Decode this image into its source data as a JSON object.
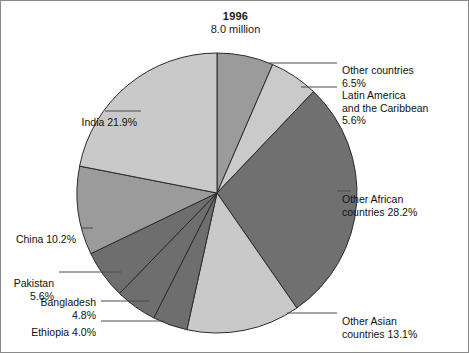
{
  "chart_data": {
    "type": "pie",
    "title": "1996",
    "subtitle": "8.0 million",
    "xlabel": "",
    "ylabel": "",
    "legend_position": "callout-labels",
    "grid": false,
    "start_angle_deg": 0,
    "direction": "clockwise",
    "categories": [
      "Other countries",
      "Latin America and the Caribbean",
      "Other African countries",
      "Other Asian countries",
      "Ethiopia",
      "Bangladesh",
      "Pakistan",
      "China",
      "India"
    ],
    "values": [
      6.5,
      5.6,
      28.2,
      13.1,
      4.0,
      4.8,
      5.6,
      10.2,
      21.9
    ],
    "unit": "percent",
    "slice_colors": [
      "#9b9b9b",
      "#cacaca",
      "#707070",
      "#c9c9c9",
      "#6e6e6e",
      "#6e6e6e",
      "#6e6e6e",
      "#9b9b9b",
      "#c9c9c9"
    ],
    "slice_stroke": "#2b2b2b",
    "annotations": [
      {
        "label": "Other countries\n6.5%",
        "side": "right"
      },
      {
        "label": "Latin America\nand the Caribbean\n5.6%",
        "side": "right"
      },
      {
        "label": "Other African\ncountries 28.2%",
        "side": "right"
      },
      {
        "label": "Other Asian\ncountries 13.1%",
        "side": "right"
      },
      {
        "label": "Ethiopia 4.0%",
        "side": "left"
      },
      {
        "label": "Bangladesh\n4.8%",
        "side": "left"
      },
      {
        "label": "Pakistan 5.6%",
        "side": "left"
      },
      {
        "label": "China 10.2%",
        "side": "left"
      },
      {
        "label": "India 21.9%",
        "side": "left"
      }
    ]
  },
  "figure": {
    "title": "1996",
    "subtitle": "8.0 million",
    "labels": {
      "other_countries": "Other countries\n6.5%",
      "latin_america": "Latin America\nand the Caribbean\n5.6%",
      "other_african": "Other African\ncountries 28.2%",
      "other_asian": "Other Asian\ncountries 13.1%",
      "ethiopia": "Ethiopia 4.0%",
      "bangladesh": "Bangladesh\n4.8%",
      "pakistan": "Pakistan 5.6%",
      "china": "China 10.2%",
      "india": "India 21.9%"
    }
  }
}
